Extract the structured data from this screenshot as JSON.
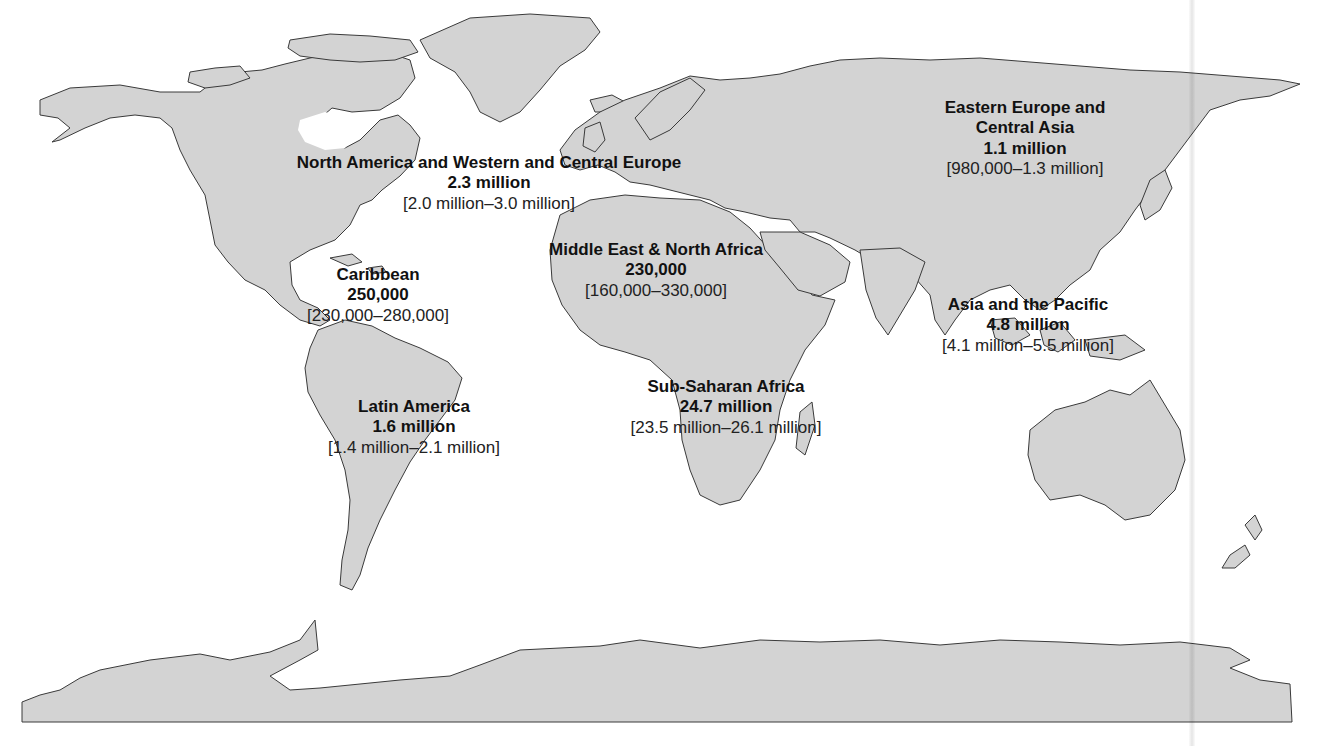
{
  "map": {
    "projection": "world",
    "colors": {
      "land": "#d3d3d3",
      "outline": "#3a3a3a",
      "water": "#ffffff",
      "label_text": "#111111"
    },
    "regions": [
      {
        "id": "north-america-western-central-europe",
        "name": "North America and Western and Central Europe",
        "value": "2.3 million",
        "range": "[2.0 million–3.0 million]"
      },
      {
        "id": "eastern-europe-central-asia",
        "name": "Eastern Europe and",
        "name_line2": "Central Asia",
        "value": "1.1 million",
        "range": "[980,000–1.3 million]"
      },
      {
        "id": "middle-east-north-africa",
        "name": "Middle East & North Africa",
        "value": "230,000",
        "range": "[160,000–330,000]"
      },
      {
        "id": "caribbean",
        "name": "Caribbean",
        "value": "250,000",
        "range": "[230,000–280,000]"
      },
      {
        "id": "asia-pacific",
        "name": "Asia and the Pacific",
        "value": "4.8 million",
        "range": "[4.1 million–5.5 million]"
      },
      {
        "id": "sub-saharan-africa",
        "name": "Sub-Saharan Africa",
        "value": "24.7 million",
        "range": "[23.5 million–26.1 million]"
      },
      {
        "id": "latin-america",
        "name": "Latin America",
        "value": "1.6 million",
        "range": "[1.4 million–2.1 million]"
      }
    ]
  }
}
